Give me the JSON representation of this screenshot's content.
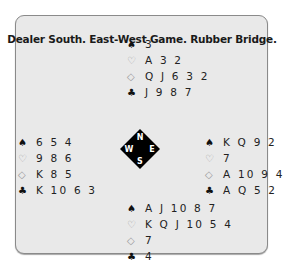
{
  "title": "Dealer South. East-West Game. Rubber Bridge.",
  "suits": {
    "spades": "♠",
    "hearts": "♡",
    "diamonds": "◇",
    "clubs": "♣"
  },
  "hands": {
    "north": {
      "spades": "3",
      "hearts": "A 3 2",
      "diamonds": "Q J 6 3 2",
      "clubs": "J 9 8 7"
    },
    "west": {
      "spades": "6 5 4",
      "hearts": "9 8 6",
      "diamonds": "K 8 5",
      "clubs": "K 10 6 3"
    },
    "east": {
      "spades": "K Q 9 2",
      "hearts": "7",
      "diamonds": "A 10 9 4",
      "clubs": "A Q 5 2"
    },
    "south": {
      "spades": "A J 10 8 7",
      "hearts": "K Q J 10 5 4",
      "diamonds": "7",
      "clubs": "4"
    }
  },
  "compass": {
    "n": "N",
    "e": "E",
    "s": "S",
    "w": "W"
  },
  "colors": {
    "panel_bg": "#e9e9e9",
    "border": "#8a8a8a",
    "compass": "#000000"
  }
}
